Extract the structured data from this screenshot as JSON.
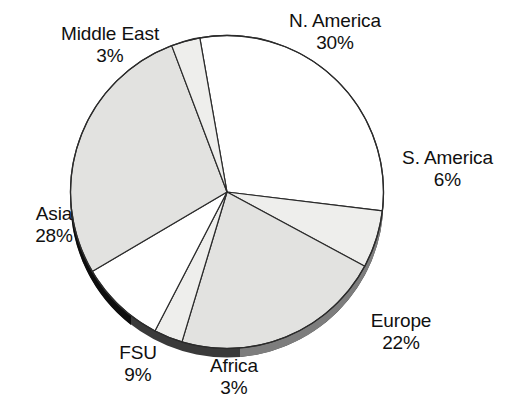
{
  "chart_data": {
    "type": "pie",
    "title": "",
    "subtitle": "",
    "xlabel": "",
    "ylabel": "",
    "legend_position": "none",
    "grid": false,
    "labels_outside": true,
    "start_angle_deg": -10,
    "direction": "clockwise",
    "categories": [
      "N. America",
      "S. America",
      "Europe",
      "Africa",
      "FSU",
      "Asia",
      "Middle East"
    ],
    "values": [
      30,
      6,
      22,
      3,
      9,
      28,
      3
    ],
    "value_suffix": "%",
    "slices": [
      {
        "label": "N. America",
        "value": 30,
        "display": "30%",
        "fill": "#ffffff",
        "stroke": "#2b2b2b"
      },
      {
        "label": "S. America",
        "value": 6,
        "display": "6%",
        "fill": "#eeeeec",
        "stroke": "#2b2b2b"
      },
      {
        "label": "Europe",
        "value": 22,
        "display": "22%",
        "fill": "#e2e2e0",
        "stroke": "#2b2b2b"
      },
      {
        "label": "Africa",
        "value": 3,
        "display": "3%",
        "fill": "#eeeeec",
        "stroke": "#2b2b2b"
      },
      {
        "label": "FSU",
        "value": 9,
        "display": "9%",
        "fill": "#ffffff",
        "stroke": "#2b2b2b"
      },
      {
        "label": "Asia",
        "value": 28,
        "display": "28%",
        "fill": "#e2e2e0",
        "stroke": "#2b2b2b"
      },
      {
        "label": "Middle East",
        "value": 3,
        "display": "3%",
        "fill": "#eeeeec",
        "stroke": "#2b2b2b"
      }
    ],
    "colors": {
      "background": "#ffffff",
      "outline": "#2b2b2b",
      "text": "#101010",
      "fill_light": "#eeeeec",
      "fill_gray": "#e2e2e0",
      "fill_white": "#ffffff",
      "rim_shadow_dark": "#111111",
      "rim_shadow_mid": "#6e6e6e"
    }
  },
  "labels": {
    "n_america": {
      "name": "N. America",
      "value": "30%"
    },
    "s_america": {
      "name": "S. America",
      "value": "6%"
    },
    "europe": {
      "name": "Europe",
      "value": "22%"
    },
    "africa": {
      "name": "Africa",
      "value": "3%"
    },
    "fsu": {
      "name": "FSU",
      "value": "9%"
    },
    "asia": {
      "name": "Asia",
      "value": "28%"
    },
    "middle_east": {
      "name": "Middle East",
      "value": "3%"
    }
  }
}
